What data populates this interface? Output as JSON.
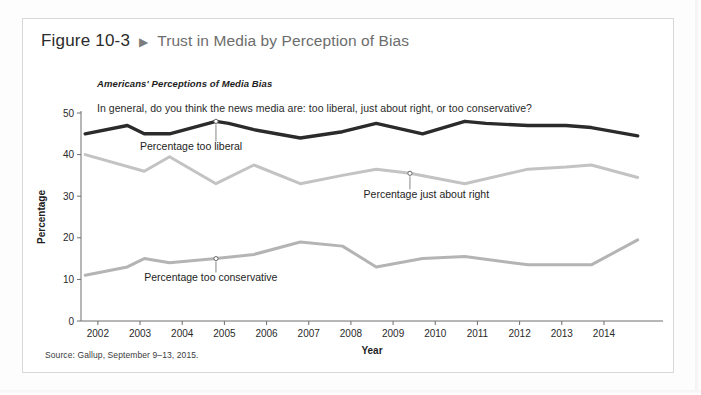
{
  "figure": {
    "number": "Figure 10-3",
    "arrow_glyph": "▶",
    "title": "Trust in Media by Perception of Bias"
  },
  "chart_header": {
    "subtitle": "Americans' Perceptions of Media Bias",
    "question": "In general, do you think the news media are: too liberal, just about right, or too conservative?"
  },
  "source": "Source: Gallup, September 9–13, 2015.",
  "colors": {
    "too_liberal": "#2b2b2b",
    "just_about_right": "#c3c3c3",
    "too_conservative": "#b4b4b4",
    "axis": "#6e6e6e",
    "frame": "#d8d8d8",
    "text": "#1d1d1d",
    "title_gray": "#6d6d6d"
  },
  "chart_data": {
    "type": "line",
    "title": "Americans' Perceptions of Media Bias",
    "subtitle": "In general, do you think the news media are: too liberal, just about right, or too conservative?",
    "xlabel": "Year",
    "ylabel": "Percentage",
    "ylim": [
      0,
      50
    ],
    "yticks": [
      0,
      10,
      20,
      30,
      40,
      50
    ],
    "xlim": [
      2001.6,
      2015.4
    ],
    "xticks": [
      2002,
      2003,
      2004,
      2005,
      2006,
      2007,
      2008,
      2009,
      2010,
      2011,
      2012,
      2013,
      2014
    ],
    "xticklabels": [
      "2002",
      "2003",
      "2004",
      "2005",
      "2006",
      "2007",
      "2008",
      "2009",
      "2010",
      "2011",
      "2012",
      "2013",
      "2014"
    ],
    "grid": false,
    "legend": "annotations-inline",
    "series": [
      {
        "name": "Percentage too liberal",
        "color": "#2b2b2b",
        "x": [
          2001.7,
          2002.7,
          2003.1,
          2003.7,
          2004.8,
          2005.1,
          2005.7,
          2006.8,
          2007.8,
          2008.6,
          2009.7,
          2010.7,
          2011.2,
          2012.2,
          2013.1,
          2013.7,
          2014.8
        ],
        "y": [
          45,
          47,
          45,
          45,
          48,
          47.5,
          46,
          44,
          45.5,
          47.5,
          45,
          48,
          47.5,
          47,
          47,
          46.5,
          44.5
        ]
      },
      {
        "name": "Percentage just about right",
        "color": "#c3c3c3",
        "x": [
          2001.7,
          2003.1,
          2003.7,
          2004.8,
          2005.7,
          2006.8,
          2007.8,
          2008.6,
          2009.4,
          2010.7,
          2012.2,
          2013.1,
          2013.7,
          2014.8
        ],
        "y": [
          40,
          36,
          39.5,
          33,
          37.5,
          33,
          35,
          36.5,
          35.5,
          33,
          36.5,
          37,
          37.5,
          34.5
        ]
      },
      {
        "name": "Percentage too conservative",
        "color": "#b4b4b4",
        "x": [
          2001.7,
          2002.7,
          2003.1,
          2003.7,
          2004.8,
          2005.7,
          2006.8,
          2007.8,
          2008.6,
          2009.7,
          2010.7,
          2012.2,
          2013.7,
          2014.8
        ],
        "y": [
          11,
          13,
          15,
          14,
          15,
          16,
          19,
          18,
          13,
          15,
          15.5,
          13.5,
          13.5,
          19.5
        ]
      }
    ],
    "annotations": [
      {
        "label": "Percentage too liberal",
        "point_x": 2004.8,
        "point_y": 48,
        "text_x": 2003.0,
        "text_y": 41
      },
      {
        "label": "Percentage just about right",
        "point_x": 2009.4,
        "point_y": 35.5,
        "text_x": 2008.3,
        "text_y": 29.5
      },
      {
        "label": "Percentage too conservative",
        "point_x": 2004.8,
        "point_y": 15,
        "text_x": 2003.1,
        "text_y": 9.5
      }
    ]
  }
}
